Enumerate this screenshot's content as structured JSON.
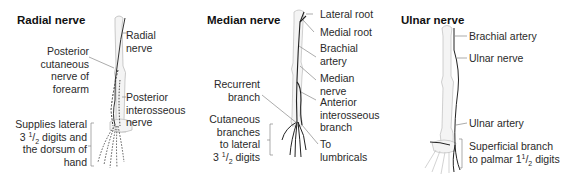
{
  "panels": [
    {
      "title": "Radial nerve",
      "labels": {
        "radial_nerve": [
          "Radial",
          "nerve"
        ],
        "posterior_cutaneous": [
          "Posterior",
          "cutaneous",
          "nerve of",
          "forearm"
        ],
        "posterior_interosseous": [
          "Posterior",
          "interosseous",
          "nerve"
        ],
        "supplies": [
          "Supplies lateral",
          "3 ",
          "1",
          "/",
          "2",
          " digits and",
          "the dorsum of",
          "hand"
        ]
      }
    },
    {
      "title": "Median nerve",
      "labels": {
        "lateral_root": "Lateral root",
        "medial_root": "Medial root",
        "brachial_artery": [
          "Brachial",
          "artery"
        ],
        "median_nerve": [
          "Median",
          "nerve"
        ],
        "anterior_interosseous": [
          "Anterior",
          "interosseous",
          "branch"
        ],
        "recurrent_branch": [
          "Recurrent",
          "branch"
        ],
        "cutaneous_branches": [
          "Cutaneous",
          "branches",
          "to lateral",
          "3 ",
          "1",
          "/",
          "2",
          " digits"
        ],
        "to_lumbricals": [
          "To",
          "lumbricals"
        ]
      }
    },
    {
      "title": "Ulnar nerve",
      "labels": {
        "brachial_artery": "Brachial artery",
        "ulnar_nerve": "Ulnar nerve",
        "ulnar_artery": "Ulnar artery",
        "superficial_branch": [
          "Superficial branch",
          "to palmar 1",
          "1",
          "/",
          "2",
          " digits"
        ]
      }
    }
  ]
}
